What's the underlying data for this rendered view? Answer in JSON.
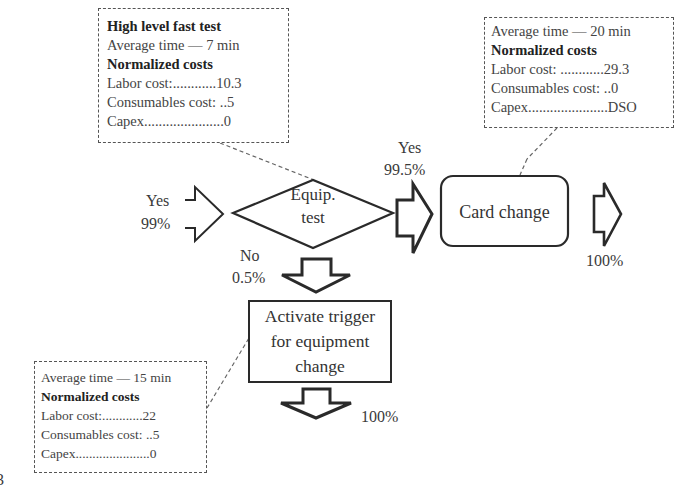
{
  "diagram": {
    "figure_fragment": "3",
    "notes": {
      "equip_test": {
        "title": "High level fast test",
        "average_time": "Average time — 7 min",
        "costs_heading": "Normalized costs",
        "labor": "Labor cost:............10.3",
        "consumables": "Consumables cost: ..5",
        "capex": "Capex......................0"
      },
      "card_change": {
        "average_time": "Average time — 20 min",
        "costs_heading": "Normalized costs",
        "labor": "Labor cost: ............29.3",
        "consumables": "Consumables cost: ..0",
        "capex": "Capex......................DSO"
      },
      "activate_trigger": {
        "average_time": "Average time — 15 min",
        "costs_heading": "Normalized costs",
        "labor": "Labor cost:............22",
        "consumables": "Consumables cost: ..5",
        "capex": "Capex......................0"
      }
    },
    "nodes": {
      "decision": {
        "line1": "Equip.",
        "line2": "test"
      },
      "card_change": {
        "label": "Card change"
      },
      "activate_trigger": {
        "line1": "Activate trigger",
        "line2": "for equipment",
        "line3": "change"
      }
    },
    "flows": {
      "input": {
        "label": "Yes",
        "pct": "99%"
      },
      "yes_branch": {
        "label": "Yes",
        "pct": "99.5%"
      },
      "no_branch": {
        "label": "No",
        "pct": "0.5%"
      },
      "card_output": {
        "pct": "100%"
      },
      "trigger_output": {
        "pct": "100%"
      }
    },
    "colors": {
      "stroke": "#2a2a2a",
      "dashed": "#555555",
      "text": "#3a3a3a"
    }
  }
}
